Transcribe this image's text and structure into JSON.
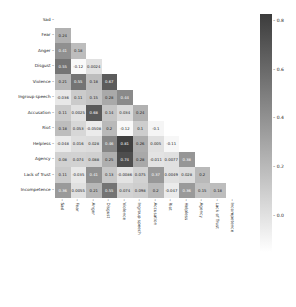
{
  "chart_data": {
    "type": "heatmap",
    "title": "",
    "subtitle": "",
    "note": "Lower-triangle correlation heatmap. Values in light cells are transcribed from visible labels. Values in dark cells (white text) were not legible at this resolution and are approximate estimates from cell shading; they are listed in approximate_cells.",
    "labels": [
      "Sad",
      "Fear",
      "Anger",
      "Disgust",
      "Violence",
      "Ingroup speech",
      "Accusation",
      "Riot",
      "Helpless",
      "Agency",
      "Lack of Trust",
      "Incompetence"
    ],
    "xlabel": "",
    "ylabel": "",
    "matrix": [
      [
        null,
        null,
        null,
        null,
        null,
        null,
        null,
        null,
        null,
        null,
        null,
        null
      ],
      [
        "0.24",
        null,
        null,
        null,
        null,
        null,
        null,
        null,
        null,
        null,
        null,
        null
      ],
      [
        "0.41",
        "0.18",
        null,
        null,
        null,
        null,
        null,
        null,
        null,
        null,
        null,
        null
      ],
      [
        "0.55",
        "-0.12",
        "0.0024",
        null,
        null,
        null,
        null,
        null,
        null,
        null,
        null,
        null
      ],
      [
        "0.21",
        "0.55",
        "0.18",
        "0.67",
        null,
        null,
        null,
        null,
        null,
        null,
        null,
        null
      ],
      [
        "-0.036",
        "0.11",
        "0.15",
        "0.28",
        "0.44",
        null,
        null,
        null,
        null,
        null,
        null,
        null
      ],
      [
        "0.11",
        "0.0025",
        "0.68",
        "0.14",
        "0.034",
        "0.24",
        null,
        null,
        null,
        null,
        null,
        null
      ],
      [
        "0.18",
        "0.053",
        "-0.0508",
        "0.2",
        "-0.12",
        "0.1",
        "-0.1",
        null,
        null,
        null,
        null,
        null
      ],
      [
        "-0.048",
        "0.016",
        "0.028",
        "0.46",
        "0.81",
        "0.26",
        "0.005",
        "-0.11",
        null,
        null,
        null,
        null
      ],
      [
        "0.08",
        "0.074",
        "0.088",
        "0.25",
        "0.74",
        "0.28",
        "-0.011",
        "0.0077",
        "0.38",
        null,
        null,
        null
      ],
      [
        "0.11",
        "-0.035",
        "0.41",
        "0.13",
        "-0.0086",
        "0.075",
        "0.37",
        "0.0049",
        "0.028",
        "0.2",
        null,
        null
      ],
      [
        "0.36",
        "0.0055",
        "0.21",
        "0.55",
        "0.074",
        "0.098",
        "0.2",
        "-0.047",
        "0.36",
        "0.15",
        "0.18",
        null
      ]
    ],
    "approximate_cells": [
      {
        "row": "Anger",
        "col": "Sad",
        "value": "0.41"
      },
      {
        "row": "Disgust",
        "col": "Sad",
        "value": "0.55"
      },
      {
        "row": "Violence",
        "col": "Fear",
        "value": "0.55"
      },
      {
        "row": "Violence",
        "col": "Disgust",
        "value": "0.67"
      },
      {
        "row": "Ingroup speech",
        "col": "Violence",
        "value": "0.44"
      },
      {
        "row": "Accusation",
        "col": "Anger",
        "value": "0.68"
      },
      {
        "row": "Helpless",
        "col": "Disgust",
        "value": "0.46"
      },
      {
        "row": "Helpless",
        "col": "Violence",
        "value": "0.81"
      },
      {
        "row": "Agency",
        "col": "Violence",
        "value": "0.74"
      },
      {
        "row": "Agency",
        "col": "Helpless",
        "value": "0.38"
      },
      {
        "row": "Lack of Trust",
        "col": "Anger",
        "value": "0.41"
      },
      {
        "row": "Lack of Trust",
        "col": "Accusation",
        "value": "0.37"
      },
      {
        "row": "Incompetence",
        "col": "Sad",
        "value": "0.36"
      },
      {
        "row": "Incompetence",
        "col": "Disgust",
        "value": "0.55"
      },
      {
        "row": "Incompetence",
        "col": "Helpless",
        "value": "0.36"
      }
    ],
    "colorbar": {
      "ticks": [
        "0.8",
        "0.6",
        "0.4",
        "0.2",
        "0.0"
      ],
      "vmin_approx": -0.15,
      "vmax_approx": 0.83,
      "colormap": "Greys"
    },
    "grid": false,
    "legend_position": "right (colorbar)"
  }
}
